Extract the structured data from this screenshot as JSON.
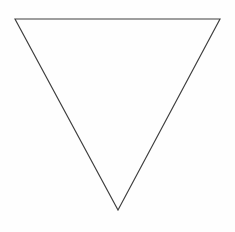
{
  "canvas": {
    "width": 235,
    "height": 232,
    "background_color": "#fefefe",
    "label": "drawing-canvas"
  },
  "figure": {
    "name": "inverted-triangle",
    "fill": "none",
    "stroke_color": "#3f3f3f",
    "stroke_width": 1.15,
    "points": "15,19 220,19 118,210",
    "vertices": [
      {
        "name": "top-left-vertex",
        "x": 15,
        "y": 19
      },
      {
        "name": "top-right-vertex",
        "x": 220,
        "y": 19
      },
      {
        "name": "bottom-apex-vertex",
        "x": 118,
        "y": 210
      }
    ],
    "edges": [
      {
        "name": "top-edge",
        "from": "top-left-vertex",
        "to": "top-right-vertex"
      },
      {
        "name": "right-edge",
        "from": "top-right-vertex",
        "to": "bottom-apex-vertex"
      },
      {
        "name": "left-edge",
        "from": "bottom-apex-vertex",
        "to": "top-left-vertex"
      }
    ]
  }
}
